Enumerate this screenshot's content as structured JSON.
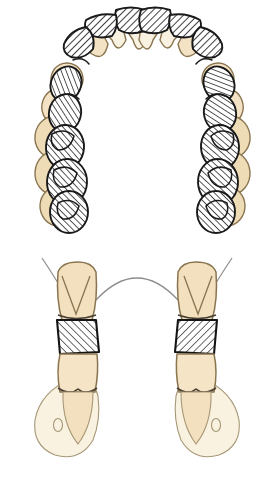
{
  "figure": {
    "background_color": "#ffffff",
    "width": 274,
    "height": 479,
    "has_text_labels": false,
    "panels": [
      {
        "id": "occlusal-arch",
        "name": "Occlusal view of maxillary dental arch",
        "bounds": [
          0,
          0,
          274,
          240
        ],
        "description": "Top-down horseshoe arch of teeth drawn in tan outline with dark diagonally hatched prosthetic tooth outlines superimposed and offset toward the palatal side"
      },
      {
        "id": "frontal-section",
        "name": "Frontal cross-section through posterior occlusion",
        "bounds": [
          0,
          240,
          274,
          239
        ],
        "description": "Left and right posterior segments showing upper molar, hatched interocclusal bite block, lower molar and pear-shaped denture base region, joined by a thin palatal vault arc"
      }
    ]
  },
  "colors": {
    "tooth_fill": "#F7E8CE",
    "tooth_fill_deep": "#EEDCB6",
    "tooth_fill_pale": "#FAF2E0",
    "tooth_outline": "#8A7550",
    "ink": "#1A1A1A",
    "hatch_line": "#1F1F1F",
    "hatch_fill": "#FFFFFF",
    "thin_grey": "#8C8C8C",
    "background": "#ffffff"
  },
  "occlusal": {
    "arch_label": "maxillary arch",
    "midline_label": "dental midline",
    "anterior_teeth": [
      {
        "name": "central-incisor-left",
        "cx": 130,
        "cy": 32,
        "rx": 15,
        "ry": 17,
        "rot": -8,
        "fill": "pale"
      },
      {
        "name": "central-incisor-right",
        "cx": 156,
        "cy": 32,
        "rx": 15,
        "ry": 17,
        "rot": 8,
        "fill": "pale"
      },
      {
        "name": "lateral-incisor-left",
        "cx": 105,
        "cy": 38,
        "rx": 14,
        "ry": 16,
        "rot": -22,
        "fill": "pale"
      },
      {
        "name": "lateral-incisor-right",
        "cx": 180,
        "cy": 38,
        "rx": 14,
        "ry": 16,
        "rot": 22,
        "fill": "pale"
      },
      {
        "name": "canine-left",
        "cx": 83,
        "cy": 53,
        "rx": 15,
        "ry": 17,
        "rot": -38,
        "fill": "tan"
      },
      {
        "name": "canine-right",
        "cx": 202,
        "cy": 53,
        "rx": 15,
        "ry": 17,
        "rot": 38,
        "fill": "tan"
      }
    ],
    "posterior_teeth_left": [
      {
        "name": "first-premolar-left",
        "cx": 67,
        "cy": 79,
        "rx": 16,
        "ry": 16,
        "rot": -58,
        "fill": "tan"
      },
      {
        "name": "second-premolar-left",
        "cx": 58,
        "cy": 106,
        "rx": 17,
        "ry": 16,
        "rot": -72,
        "fill": "tan"
      },
      {
        "name": "first-molar-left",
        "cx": 54,
        "cy": 137,
        "rx": 20,
        "ry": 19,
        "rot": -82,
        "fill": "tan"
      },
      {
        "name": "second-molar-left",
        "cx": 55,
        "cy": 173,
        "rx": 21,
        "ry": 20,
        "rot": -86,
        "fill": "tan"
      },
      {
        "name": "third-molar-left",
        "cx": 58,
        "cy": 206,
        "rx": 20,
        "ry": 19,
        "rot": -88,
        "fill": "tan"
      }
    ],
    "posterior_teeth_right": [
      {
        "name": "first-premolar-right",
        "cx": 218,
        "cy": 79,
        "rx": 16,
        "ry": 16,
        "rot": 58,
        "fill": "tan"
      },
      {
        "name": "second-premolar-right",
        "cx": 227,
        "cy": 106,
        "rx": 17,
        "ry": 16,
        "rot": 72,
        "fill": "tan"
      },
      {
        "name": "first-molar-right",
        "cx": 231,
        "cy": 137,
        "rx": 20,
        "ry": 19,
        "rot": 82,
        "fill": "tan"
      },
      {
        "name": "second-molar-right",
        "cx": 230,
        "cy": 173,
        "rx": 21,
        "ry": 20,
        "rot": 86,
        "fill": "tan"
      },
      {
        "name": "third-molar-right",
        "cx": 227,
        "cy": 206,
        "rx": 20,
        "ry": 19,
        "rot": 88,
        "fill": "tan"
      }
    ],
    "hatched_overlays": [
      {
        "name": "overlay-central-incisor-left",
        "cx": 128,
        "cy": 24,
        "rx": 17,
        "ry": 14,
        "rot": -10
      },
      {
        "name": "overlay-central-incisor-right",
        "cx": 159,
        "cy": 24,
        "rx": 17,
        "ry": 14,
        "rot": 10
      },
      {
        "name": "overlay-lateral-incisor-left",
        "cx": 100,
        "cy": 33,
        "rx": 16,
        "ry": 13,
        "rot": -28
      },
      {
        "name": "overlay-lateral-incisor-right",
        "cx": 187,
        "cy": 33,
        "rx": 16,
        "ry": 13,
        "rot": 28
      },
      {
        "name": "overlay-canine-left",
        "cx": 76,
        "cy": 54,
        "rx": 16,
        "ry": 15,
        "rot": -48
      },
      {
        "name": "overlay-canine-right",
        "cx": 211,
        "cy": 54,
        "rx": 16,
        "ry": 15,
        "rot": 48
      },
      {
        "name": "overlay-first-premolar-left",
        "cx": 66,
        "cy": 84,
        "rx": 17,
        "ry": 15,
        "rot": -66
      },
      {
        "name": "overlay-first-premolar-right",
        "cx": 221,
        "cy": 84,
        "rx": 17,
        "ry": 15,
        "rot": 66
      },
      {
        "name": "overlay-second-premolar-left",
        "cx": 64,
        "cy": 113,
        "rx": 18,
        "ry": 16,
        "rot": -78
      },
      {
        "name": "overlay-second-premolar-right",
        "cx": 223,
        "cy": 113,
        "rx": 18,
        "ry": 16,
        "rot": 78
      },
      {
        "name": "overlay-first-molar-left",
        "cx": 64,
        "cy": 147,
        "rx": 21,
        "ry": 19,
        "rot": -86
      },
      {
        "name": "overlay-first-molar-right",
        "cx": 223,
        "cy": 147,
        "rx": 21,
        "ry": 19,
        "rot": 86
      },
      {
        "name": "overlay-second-molar-left",
        "cx": 66,
        "cy": 182,
        "rx": 22,
        "ry": 20,
        "rot": -88
      },
      {
        "name": "overlay-second-molar-right",
        "cx": 221,
        "cy": 182,
        "rx": 22,
        "ry": 20,
        "rot": 88
      },
      {
        "name": "overlay-third-molar-left",
        "cx": 68,
        "cy": 212,
        "rx": 21,
        "ry": 19,
        "rot": -90
      },
      {
        "name": "overlay-third-molar-right",
        "cx": 219,
        "cy": 212,
        "rx": 21,
        "ry": 19,
        "rot": 90
      }
    ]
  },
  "section": {
    "palatal_arc_label": "palatal vault outline",
    "sides": [
      {
        "id": "left-segment",
        "name": "left posterior segment",
        "mirrored": false,
        "upper_tooth": {
          "name": "upper-molar-left",
          "cusps": 2
        },
        "bite_block": {
          "name": "bite-block-left",
          "hatched": true
        },
        "lower_tooth": {
          "name": "lower-molar-left"
        },
        "base": {
          "name": "denture-base-left",
          "marking": "oval-landmark"
        }
      },
      {
        "id": "right-segment",
        "name": "right posterior segment",
        "mirrored": true,
        "upper_tooth": {
          "name": "upper-molar-right",
          "cusps": 2
        },
        "bite_block": {
          "name": "bite-block-right",
          "hatched": true
        },
        "lower_tooth": {
          "name": "lower-molar-right"
        },
        "base": {
          "name": "denture-base-right",
          "marking": "oval-landmark"
        }
      }
    ]
  }
}
